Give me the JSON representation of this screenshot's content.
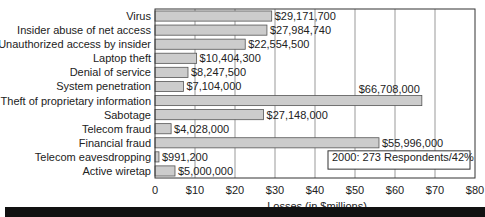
{
  "chart_data": {
    "type": "bar",
    "orientation": "horizontal",
    "categories": [
      "Virus",
      "Insider abuse of net access",
      "Unauthorized access by insider",
      "Laptop theft",
      "Denial of service",
      "System penetration",
      "Theft of proprietary information",
      "Sabotage",
      "Telecom fraud",
      "Financial fraud",
      "Telecom eavesdropping",
      "Active wiretap"
    ],
    "values": [
      29.1717,
      27.98474,
      22.5545,
      10.4043,
      8.2475,
      7.104,
      66.708,
      27.148,
      4.028,
      55.996,
      0.9912,
      5.0
    ],
    "value_labels": [
      "$29,171,700",
      "$27,984,740",
      "$22,554,500",
      "$10,404,300",
      "$8,247,500",
      "$7,104,000",
      "$66,708,000",
      "$27,148,000",
      "$4,028,000",
      "$55,996,000",
      "$991,200",
      "$5,000,000"
    ],
    "title": "",
    "xlabel": "Losses (in $millions)",
    "ylabel": "",
    "xlim": [
      0,
      80
    ],
    "xticks": [
      0,
      10,
      20,
      30,
      40,
      50,
      60,
      70,
      80
    ],
    "xtick_labels": [
      "0",
      "$10",
      "$20",
      "$30",
      "$40",
      "$50",
      "$60",
      "$70",
      "$80"
    ],
    "grid": "vertical",
    "annotation": "2000:  273 Respondents/42%",
    "colors": {
      "bar_fill": "#cccccc",
      "bar_stroke": "#555555",
      "grid": "#999999",
      "frame": "#333333"
    }
  }
}
